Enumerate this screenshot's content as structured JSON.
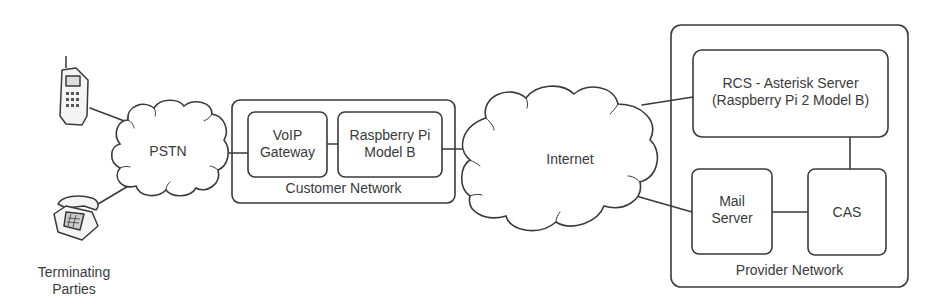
{
  "diagram": {
    "nodes": {
      "mobile_phone": {
        "icon": "mobile-phone-icon"
      },
      "desk_phone": {
        "icon": "desk-phone-icon"
      },
      "terminating_parties": {
        "line1": "Terminating",
        "line2": "Parties"
      },
      "pstn": {
        "label": "PSTN"
      },
      "voip_gateway": {
        "line1": "VoIP",
        "line2": "Gateway"
      },
      "raspberry_pi": {
        "line1": "Raspberry Pi",
        "line2": "Model B"
      },
      "customer_network": {
        "label": "Customer Network"
      },
      "internet": {
        "label": "Internet"
      },
      "rcs_server": {
        "line1": "RCS - Asterisk Server",
        "line2": "(Raspberry Pi 2 Model B)"
      },
      "mail_server": {
        "line1": "Mail",
        "line2": "Server"
      },
      "cas": {
        "label": "CAS"
      },
      "provider_network": {
        "label": "Provider Network"
      }
    },
    "edges": [
      [
        "mobile_phone",
        "pstn"
      ],
      [
        "desk_phone",
        "pstn"
      ],
      [
        "pstn",
        "voip_gateway"
      ],
      [
        "voip_gateway",
        "raspberry_pi"
      ],
      [
        "raspberry_pi",
        "internet"
      ],
      [
        "internet",
        "rcs_server"
      ],
      [
        "internet",
        "mail_server"
      ],
      [
        "mail_server",
        "cas"
      ],
      [
        "rcs_server",
        "cas"
      ]
    ],
    "colors": {
      "stroke": "#3a3a3a",
      "background": "#ffffff"
    }
  }
}
